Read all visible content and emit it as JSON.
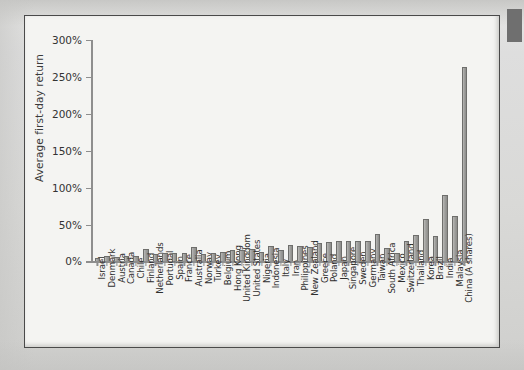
{
  "figure": {
    "background_color": "#f4f4f2",
    "frame_color": "#4a4a4a",
    "bar_color": "#9f9f9d",
    "axis_color": "#8e8e8e",
    "corner_mark_color": "#6f6f6f"
  },
  "chart_data": {
    "type": "bar",
    "title": "",
    "subtitle": "",
    "xlabel": "",
    "ylabel": "Average first-day return",
    "ylim": [
      0,
      300
    ],
    "ytick_labels": [
      "0%",
      "50%",
      "100%",
      "150%",
      "200%",
      "250%",
      "300%"
    ],
    "ytick_values": [
      0,
      50,
      100,
      150,
      200,
      250,
      300
    ],
    "grid": false,
    "legend": null,
    "legend_position": "none",
    "unit": "percent",
    "categories": [
      "Israel",
      "Denmark",
      "Austria",
      "Canada",
      "Chile",
      "Finland",
      "Netherlands",
      "Portugal",
      "Spain",
      "France",
      "Australia",
      "Norway",
      "Turkey",
      "Belgium",
      "Hong Kong",
      "United Kingdom",
      "United States",
      "Nigeria",
      "Indonesia",
      "Italy",
      "Iran",
      "Philippines",
      "New Zealand",
      "Greece",
      "Poland",
      "Japan",
      "Singapore",
      "Sweden",
      "Germany",
      "Taiwan",
      "South Africa",
      "Mexico",
      "Switzerland",
      "Thailand",
      "Korea",
      "Brazil",
      "India",
      "Malaysia",
      "China (A shares)"
    ],
    "values": [
      4,
      7,
      6,
      7,
      8,
      17,
      10,
      12,
      11,
      11,
      20,
      10,
      11,
      13,
      16,
      16,
      17,
      13,
      21,
      15,
      22,
      21,
      20,
      25,
      26,
      27,
      28,
      28,
      27,
      37,
      18,
      11,
      28,
      36,
      58,
      34,
      90,
      61,
      263
    ],
    "highest": {
      "label": "China (A shares)",
      "value": 263
    },
    "lowest": {
      "label": "Israel",
      "value": 4
    }
  }
}
